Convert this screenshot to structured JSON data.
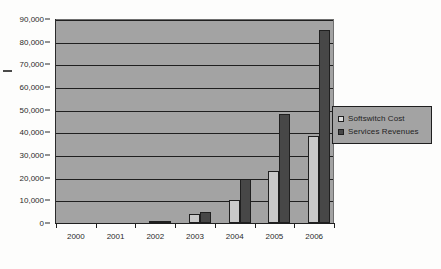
{
  "chart_data": {
    "type": "bar",
    "title": "",
    "subtitle": "",
    "xlabel": "",
    "ylabel": "",
    "categories": [
      "2000",
      "2001",
      "2002",
      "2003",
      "2004",
      "2005",
      "2006"
    ],
    "series": [
      {
        "name": "Softswitch Cost",
        "color": "#c9c9c9",
        "values": [
          0,
          0,
          500,
          4000,
          10000,
          23000,
          38500
        ]
      },
      {
        "name": "Services Revenues",
        "color": "#474747",
        "values": [
          0,
          0,
          900,
          5000,
          19500,
          48000,
          85000
        ]
      }
    ],
    "ylim": [
      0,
      90000
    ],
    "ytick_step": 10000,
    "ytick_labels": [
      "0",
      "10,000",
      "20,000",
      "30,000",
      "40,000",
      "50,000",
      "60,000",
      "70,000",
      "80,000",
      "90,000"
    ],
    "grid": true,
    "grid_axis": "y",
    "legend_position": "right",
    "plot_background": "#a3a3a3",
    "page_background": "#fdfdfc",
    "axis_color": "#1f1f1f"
  },
  "legend": {
    "items": [
      {
        "label": "Softswitch Cost",
        "swatch": "cost"
      },
      {
        "label": "Services Revenues",
        "swatch": "rev"
      }
    ]
  },
  "icons": {
    "legend_swatch_cost": "light-gray-square-icon",
    "legend_swatch_rev": "dark-gray-square-icon"
  }
}
